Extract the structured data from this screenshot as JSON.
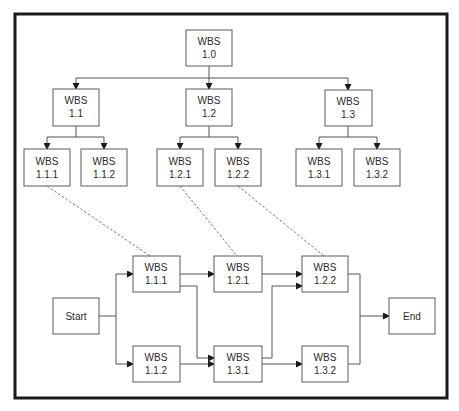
{
  "diagram": {
    "hierarchy": {
      "root": {
        "id": "1.0",
        "line1": "WBS",
        "line2": "1.0"
      },
      "level2": [
        {
          "id": "1.1",
          "line1": "WBS",
          "line2": "1.1"
        },
        {
          "id": "1.2",
          "line1": "WBS",
          "line2": "1.2"
        },
        {
          "id": "1.3",
          "line1": "WBS",
          "line2": "1.3"
        }
      ],
      "level3": [
        {
          "id": "1.1.1",
          "line1": "WBS",
          "line2": "1.1.1"
        },
        {
          "id": "1.1.2",
          "line1": "WBS",
          "line2": "1.1.2"
        },
        {
          "id": "1.2.1",
          "line1": "WBS",
          "line2": "1.2.1"
        },
        {
          "id": "1.2.2",
          "line1": "WBS",
          "line2": "1.2.2"
        },
        {
          "id": "1.3.1",
          "line1": "WBS",
          "line2": "1.3.1"
        },
        {
          "id": "1.3.2",
          "line1": "WBS",
          "line2": "1.3.2"
        }
      ]
    },
    "network": {
      "start": {
        "label": "Start"
      },
      "end": {
        "label": "End"
      },
      "nodes": [
        {
          "id": "1.1.1",
          "line1": "WBS",
          "line2": "1.1.1"
        },
        {
          "id": "1.1.2",
          "line1": "WBS",
          "line2": "1.1.2"
        },
        {
          "id": "1.2.1",
          "line1": "WBS",
          "line2": "1.2.1"
        },
        {
          "id": "1.3.1",
          "line1": "WBS",
          "line2": "1.3.1"
        },
        {
          "id": "1.2.2",
          "line1": "WBS",
          "line2": "1.2.2"
        },
        {
          "id": "1.3.2",
          "line1": "WBS",
          "line2": "1.3.2"
        }
      ],
      "edges": [
        [
          "Start",
          "1.1.1"
        ],
        [
          "Start",
          "1.1.2"
        ],
        [
          "1.1.1",
          "1.2.1"
        ],
        [
          "1.1.1",
          "1.3.1"
        ],
        [
          "1.1.2",
          "1.3.1"
        ],
        [
          "1.2.1",
          "1.2.2"
        ],
        [
          "1.3.1",
          "1.2.2"
        ],
        [
          "1.3.1",
          "1.3.2"
        ],
        [
          "1.2.2",
          "End"
        ],
        [
          "1.3.2",
          "End"
        ]
      ]
    },
    "mappings": [
      [
        "1.1.1",
        "1.1.1"
      ],
      [
        "1.2.1",
        "1.2.1"
      ],
      [
        "1.2.2",
        "1.2.2"
      ]
    ],
    "colors": {
      "frame": "#1a1a1a",
      "box_border": "#5a5a5a",
      "line": "#555555",
      "text": "#2a2a2a",
      "background": "#ffffff"
    }
  }
}
